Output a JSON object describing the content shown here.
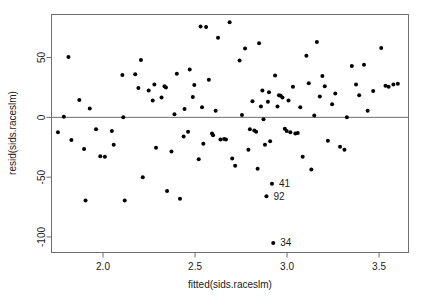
{
  "chart_data": {
    "type": "scatter",
    "title": "",
    "subtitle": "",
    "xlabel": "fitted(sids.raceslm)",
    "ylabel": "resid(sids.raceslm)",
    "xlim": [
      1.72,
      3.66
    ],
    "ylim": [
      -113,
      86
    ],
    "xticks": [
      2.0,
      2.5,
      3.0,
      3.5
    ],
    "xtick_labels": [
      "2.0",
      "2.5",
      "3.0",
      "3.5"
    ],
    "yticks": [
      50,
      0,
      -50,
      -100
    ],
    "ytick_labels": [
      "50",
      "0",
      "-50",
      "-100"
    ],
    "grid": false,
    "legend": null,
    "reference_lines": [
      {
        "name": "zero-residual-line",
        "orientation": "horizontal",
        "y": 0
      }
    ],
    "marker": {
      "shape": "circle",
      "color": "#000000",
      "size": 2.0
    },
    "points": [
      {
        "x": 1.755,
        "y": -12.5
      },
      {
        "x": 1.787,
        "y": 0.5
      },
      {
        "x": 1.812,
        "y": 50.5
      },
      {
        "x": 1.828,
        "y": -19.0
      },
      {
        "x": 1.871,
        "y": 14.5
      },
      {
        "x": 1.897,
        "y": -26.5
      },
      {
        "x": 1.905,
        "y": -69.5
      },
      {
        "x": 1.928,
        "y": 7.5
      },
      {
        "x": 1.962,
        "y": -10.0
      },
      {
        "x": 1.985,
        "y": -32.5
      },
      {
        "x": 2.01,
        "y": -33.0
      },
      {
        "x": 2.048,
        "y": -11.5
      },
      {
        "x": 2.058,
        "y": -23.0
      },
      {
        "x": 2.105,
        "y": 35.5
      },
      {
        "x": 2.11,
        "y": 0.0
      },
      {
        "x": 2.118,
        "y": -69.5
      },
      {
        "x": 2.175,
        "y": 36.0
      },
      {
        "x": 2.192,
        "y": 24.5
      },
      {
        "x": 2.206,
        "y": 48.0
      },
      {
        "x": 2.216,
        "y": -50.0
      },
      {
        "x": 2.248,
        "y": 22.5
      },
      {
        "x": 2.27,
        "y": 14.0
      },
      {
        "x": 2.279,
        "y": 27.5
      },
      {
        "x": 2.288,
        "y": -25.5
      },
      {
        "x": 2.318,
        "y": 16.5
      },
      {
        "x": 2.334,
        "y": 26.0
      },
      {
        "x": 2.342,
        "y": 25.0
      },
      {
        "x": 2.348,
        "y": -61.5
      },
      {
        "x": 2.372,
        "y": -28.5
      },
      {
        "x": 2.388,
        "y": 2.5
      },
      {
        "x": 2.401,
        "y": 36.5
      },
      {
        "x": 2.418,
        "y": -68.0
      },
      {
        "x": 2.438,
        "y": -16.0
      },
      {
        "x": 2.443,
        "y": 7.0
      },
      {
        "x": 2.462,
        "y": -12.0
      },
      {
        "x": 2.471,
        "y": 40.0
      },
      {
        "x": 2.488,
        "y": 17.0
      },
      {
        "x": 2.496,
        "y": 27.0
      },
      {
        "x": 2.52,
        "y": -35.0
      },
      {
        "x": 2.53,
        "y": 76.0
      },
      {
        "x": 2.538,
        "y": 8.5
      },
      {
        "x": 2.545,
        "y": -22.0
      },
      {
        "x": 2.56,
        "y": 75.5
      },
      {
        "x": 2.575,
        "y": 31.5
      },
      {
        "x": 2.592,
        "y": -13.5
      },
      {
        "x": 2.598,
        "y": -15.0
      },
      {
        "x": 2.612,
        "y": 5.5
      },
      {
        "x": 2.625,
        "y": 66.5
      },
      {
        "x": 2.638,
        "y": -18.5
      },
      {
        "x": 2.658,
        "y": -18.0
      },
      {
        "x": 2.668,
        "y": -18.5
      },
      {
        "x": 2.688,
        "y": 79.5
      },
      {
        "x": 2.702,
        "y": -34.5
      },
      {
        "x": 2.718,
        "y": -40.5
      },
      {
        "x": 2.742,
        "y": 47.5
      },
      {
        "x": 2.755,
        "y": 2.0
      },
      {
        "x": 2.772,
        "y": 57.5
      },
      {
        "x": 2.79,
        "y": -27.0
      },
      {
        "x": 2.798,
        "y": -10.0
      },
      {
        "x": 2.812,
        "y": 13.5
      },
      {
        "x": 2.822,
        "y": -11.0
      },
      {
        "x": 2.832,
        "y": -12.0
      },
      {
        "x": 2.84,
        "y": -43.0
      },
      {
        "x": 2.848,
        "y": 62.0
      },
      {
        "x": 2.858,
        "y": 9.0
      },
      {
        "x": 2.866,
        "y": 22.5
      },
      {
        "x": 2.872,
        "y": -1.5
      },
      {
        "x": 2.88,
        "y": -23.0
      },
      {
        "x": 2.888,
        "y": -66.0
      },
      {
        "x": 2.896,
        "y": 13.0
      },
      {
        "x": 2.902,
        "y": 21.0
      },
      {
        "x": 2.908,
        "y": -20.0
      },
      {
        "x": 2.918,
        "y": -55.5
      },
      {
        "x": 2.925,
        "y": -105.0
      },
      {
        "x": 2.935,
        "y": 35.0
      },
      {
        "x": 2.948,
        "y": 9.0
      },
      {
        "x": 2.956,
        "y": 18.5
      },
      {
        "x": 2.965,
        "y": 18.0
      },
      {
        "x": 2.975,
        "y": 16.5
      },
      {
        "x": 2.988,
        "y": -9.5
      },
      {
        "x": 2.998,
        "y": -11.5
      },
      {
        "x": 3.008,
        "y": 14.0
      },
      {
        "x": 3.018,
        "y": -12.5
      },
      {
        "x": 3.032,
        "y": 25.5
      },
      {
        "x": 3.045,
        "y": -13.5
      },
      {
        "x": 3.058,
        "y": -13.0
      },
      {
        "x": 3.072,
        "y": 8.5
      },
      {
        "x": 3.085,
        "y": -33.0
      },
      {
        "x": 3.105,
        "y": 51.5
      },
      {
        "x": 3.118,
        "y": 28.5
      },
      {
        "x": 3.132,
        "y": -43.5
      },
      {
        "x": 3.148,
        "y": 1.5
      },
      {
        "x": 3.162,
        "y": 63.0
      },
      {
        "x": 3.178,
        "y": 17.5
      },
      {
        "x": 3.192,
        "y": 34.5
      },
      {
        "x": 3.205,
        "y": 26.0
      },
      {
        "x": 3.222,
        "y": -19.5
      },
      {
        "x": 3.245,
        "y": 11.0
      },
      {
        "x": 3.262,
        "y": 20.0
      },
      {
        "x": 3.288,
        "y": -24.5
      },
      {
        "x": 3.312,
        "y": -27.0
      },
      {
        "x": 3.325,
        "y": 0.0
      },
      {
        "x": 3.352,
        "y": 43.0
      },
      {
        "x": 3.375,
        "y": 27.5
      },
      {
        "x": 3.392,
        "y": 18.5
      },
      {
        "x": 3.418,
        "y": 44.0
      },
      {
        "x": 3.438,
        "y": 5.5
      },
      {
        "x": 3.468,
        "y": 22.0
      },
      {
        "x": 3.512,
        "y": 58.0
      },
      {
        "x": 3.535,
        "y": 26.5
      },
      {
        "x": 3.552,
        "y": 25.5
      },
      {
        "x": 3.578,
        "y": 27.5
      },
      {
        "x": 3.602,
        "y": 28.0
      }
    ],
    "labeled_points": [
      {
        "label": "41",
        "x": 2.918,
        "y": -55.5,
        "label_position": "right"
      },
      {
        "label": "92",
        "x": 2.888,
        "y": -66.0,
        "label_position": "right"
      },
      {
        "label": "34",
        "x": 2.925,
        "y": -105.0,
        "label_position": "right"
      }
    ]
  },
  "axes": {
    "x_title": "fitted(sids.raceslm)",
    "y_title": "resid(sids.raceslm)"
  }
}
